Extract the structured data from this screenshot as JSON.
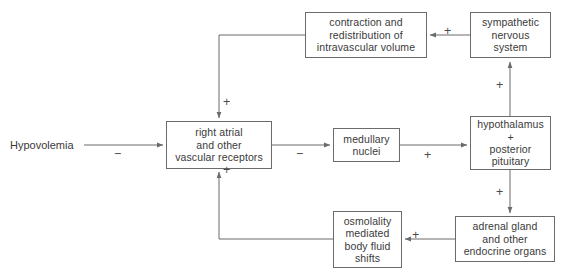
{
  "diagram": {
    "line_color": "#6b6b6b",
    "text_color": "#3a3a3a",
    "background": "#ffffff",
    "source_label": {
      "text": "Hypovolemia"
    },
    "nodes": [
      {
        "id": "contraction",
        "lines": [
          "contraction and",
          "redistribution of",
          "intravascular volume"
        ]
      },
      {
        "id": "sympathetic",
        "lines": [
          "sympathetic",
          "nervous",
          "system"
        ]
      },
      {
        "id": "right-atrial",
        "lines": [
          "right atrial",
          "and other",
          "vascular receptors"
        ]
      },
      {
        "id": "medullary",
        "lines": [
          "medullary",
          "nuclei"
        ]
      },
      {
        "id": "hypothalamus",
        "lines": [
          "hypothalamus",
          "+",
          "posterior",
          "pituitary"
        ]
      },
      {
        "id": "osmolality",
        "lines": [
          "osmolality",
          "mediated",
          "body fluid",
          "shifts"
        ]
      },
      {
        "id": "adrenal",
        "lines": [
          "adrenal gland",
          "and other",
          "endocrine organs"
        ]
      }
    ],
    "edge_signs": [
      {
        "id": "sign-hypovolemia-to-receptors",
        "text": "−"
      },
      {
        "id": "sign-contraction-to-receptors",
        "text": "+"
      },
      {
        "id": "sign-sympathetic-to-contraction",
        "text": "+"
      },
      {
        "id": "sign-receptors-to-medullary",
        "text": "−"
      },
      {
        "id": "sign-medullary-to-hypothalamus",
        "text": "+"
      },
      {
        "id": "sign-hypothalamus-to-sympathetic",
        "text": "+"
      },
      {
        "id": "sign-hypothalamus-to-adrenal",
        "text": "+"
      },
      {
        "id": "sign-adrenal-to-osmolality",
        "text": "+"
      },
      {
        "id": "sign-osmolality-to-receptors",
        "text": "+"
      }
    ]
  }
}
